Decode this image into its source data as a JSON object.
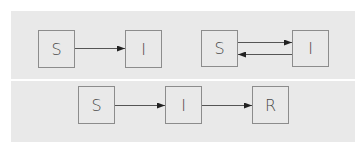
{
  "diagrams": [
    {
      "name": "SI model",
      "nodes": [
        {
          "id": "S",
          "label": "S"
        },
        {
          "id": "I",
          "label": "I"
        }
      ],
      "edges": [
        {
          "from": "S",
          "to": "I"
        }
      ]
    },
    {
      "name": "SIS model",
      "nodes": [
        {
          "id": "S",
          "label": "S"
        },
        {
          "id": "I",
          "label": "I"
        }
      ],
      "edges": [
        {
          "from": "S",
          "to": "I"
        },
        {
          "from": "I",
          "to": "S"
        }
      ]
    },
    {
      "name": "SIR model",
      "nodes": [
        {
          "id": "S",
          "label": "S"
        },
        {
          "id": "I",
          "label": "I"
        },
        {
          "id": "R",
          "label": "R"
        }
      ],
      "edges": [
        {
          "from": "S",
          "to": "I"
        },
        {
          "from": "I",
          "to": "R"
        }
      ]
    }
  ],
  "colors": {
    "panel_background": "#e9e9e9",
    "box_border": "#8c8c8c",
    "arrow": "#333333",
    "text": "#4a4a4a",
    "separator": "#ffffff"
  }
}
